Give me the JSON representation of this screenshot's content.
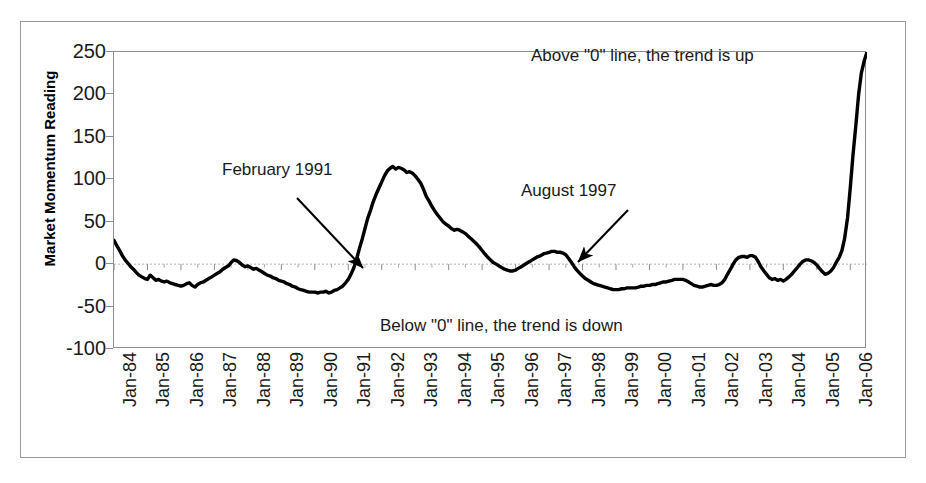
{
  "chart_data": {
    "type": "line",
    "title": "",
    "xlabel": "",
    "ylabel": "Market Momentum Reading",
    "ylim": [
      -100,
      250
    ],
    "ytick_values": [
      250,
      200,
      150,
      100,
      50,
      0,
      -50,
      -100
    ],
    "ytick_labels": [
      "250",
      "200",
      "150",
      "100",
      "50",
      "0",
      "-50",
      "-100"
    ],
    "grid": false,
    "zero_line": 0,
    "legend": "none",
    "xtick_labels": [
      "Jan-84",
      "Jan-85",
      "Jan-86",
      "Jan-87",
      "Jan-88",
      "Jan-89",
      "Jan-90",
      "Jan-91",
      "Jan-92",
      "Jan-93",
      "Jan-94",
      "Jan-95",
      "Jan-96",
      "Jan-97",
      "Jan-98",
      "Jan-99",
      "Jan-00",
      "Jan-01",
      "Jan-02",
      "Jan-03",
      "Jan-04",
      "Jan-05",
      "Jan-06"
    ],
    "series": [
      {
        "name": "Market Momentum Reading",
        "color": "#000000",
        "x": [
          1984.0,
          1984.08,
          1984.17,
          1984.25,
          1984.33,
          1984.42,
          1984.5,
          1984.58,
          1984.67,
          1984.75,
          1984.83,
          1984.92,
          1985.0,
          1985.08,
          1985.17,
          1985.25,
          1985.33,
          1985.42,
          1985.5,
          1985.58,
          1985.67,
          1985.75,
          1985.83,
          1985.92,
          1986.0,
          1986.08,
          1986.17,
          1986.25,
          1986.33,
          1986.42,
          1986.5,
          1986.58,
          1986.67,
          1986.75,
          1986.83,
          1986.92,
          1987.0,
          1987.08,
          1987.17,
          1987.25,
          1987.33,
          1987.42,
          1987.5,
          1987.58,
          1987.67,
          1987.75,
          1987.83,
          1987.92,
          1988.0,
          1988.08,
          1988.17,
          1988.25,
          1988.33,
          1988.42,
          1988.5,
          1988.58,
          1988.67,
          1988.75,
          1988.83,
          1988.92,
          1989.0,
          1989.08,
          1989.17,
          1989.25,
          1989.33,
          1989.42,
          1989.5,
          1989.58,
          1989.67,
          1989.75,
          1989.83,
          1989.92,
          1990.0,
          1990.08,
          1990.17,
          1990.25,
          1990.33,
          1990.42,
          1990.5,
          1990.58,
          1990.67,
          1990.75,
          1990.83,
          1990.92,
          1991.0,
          1991.08,
          1991.17,
          1991.25,
          1991.33,
          1991.42,
          1991.5,
          1991.58,
          1991.67,
          1991.75,
          1991.83,
          1991.92,
          1992.0,
          1992.08,
          1992.17,
          1992.25,
          1992.33,
          1992.42,
          1992.5,
          1992.58,
          1992.67,
          1992.75,
          1992.83,
          1992.92,
          1993.0,
          1993.08,
          1993.17,
          1993.25,
          1993.33,
          1993.42,
          1993.5,
          1993.58,
          1993.67,
          1993.75,
          1993.83,
          1993.92,
          1994.0,
          1994.08,
          1994.17,
          1994.25,
          1994.33,
          1994.42,
          1994.5,
          1994.58,
          1994.67,
          1994.75,
          1994.83,
          1994.92,
          1995.0,
          1995.08,
          1995.17,
          1995.25,
          1995.33,
          1995.42,
          1995.5,
          1995.58,
          1995.67,
          1995.75,
          1995.83,
          1995.92,
          1996.0,
          1996.08,
          1996.17,
          1996.25,
          1996.33,
          1996.42,
          1996.5,
          1996.58,
          1996.67,
          1996.75,
          1996.83,
          1996.92,
          1997.0,
          1997.08,
          1997.17,
          1997.25,
          1997.33,
          1997.42,
          1997.5,
          1997.58,
          1997.67,
          1997.75,
          1997.83,
          1997.92,
          1998.0,
          1998.08,
          1998.17,
          1998.25,
          1998.33,
          1998.42,
          1998.5,
          1998.58,
          1998.67,
          1998.75,
          1998.83,
          1998.92,
          1999.0,
          1999.08,
          1999.17,
          1999.25,
          1999.33,
          1999.42,
          1999.5,
          1999.58,
          1999.67,
          1999.75,
          1999.83,
          1999.92,
          2000.0,
          2000.08,
          2000.17,
          2000.25,
          2000.33,
          2000.42,
          2000.5,
          2000.58,
          2000.67,
          2000.75,
          2000.83,
          2000.92,
          2001.0,
          2001.08,
          2001.17,
          2001.25,
          2001.33,
          2001.42,
          2001.5,
          2001.58,
          2001.67,
          2001.75,
          2001.83,
          2001.92,
          2002.0,
          2002.08,
          2002.17,
          2002.25,
          2002.33,
          2002.42,
          2002.5,
          2002.58,
          2002.67,
          2002.75,
          2002.83,
          2002.92,
          2003.0,
          2003.08,
          2003.17,
          2003.25,
          2003.33,
          2003.42,
          2003.5,
          2003.58,
          2003.67,
          2003.75,
          2003.83,
          2003.92,
          2004.0,
          2004.08,
          2004.17,
          2004.25,
          2004.33,
          2004.42,
          2004.5,
          2004.58,
          2004.67,
          2004.75,
          2004.83,
          2004.92,
          2005.0,
          2005.08,
          2005.17,
          2005.25,
          2005.33,
          2005.42,
          2005.5,
          2005.58,
          2005.67,
          2005.75,
          2005.83,
          2005.92,
          2006.0,
          2006.08,
          2006.17,
          2006.25,
          2006.33,
          2006.42,
          2006.5
        ],
        "y": [
          28,
          22,
          16,
          10,
          5,
          1,
          -3,
          -6,
          -10,
          -13,
          -15,
          -17,
          -18,
          -13,
          -16,
          -19,
          -18,
          -20,
          -21,
          -20,
          -22,
          -23,
          -24,
          -25,
          -26,
          -25,
          -23,
          -22,
          -25,
          -27,
          -24,
          -22,
          -21,
          -19,
          -17,
          -15,
          -13,
          -11,
          -9,
          -6,
          -4,
          -2,
          2,
          5,
          4,
          2,
          -1,
          -3,
          -2,
          -4,
          -6,
          -5,
          -7,
          -9,
          -11,
          -13,
          -14,
          -16,
          -17,
          -19,
          -20,
          -21,
          -23,
          -24,
          -26,
          -27,
          -29,
          -30,
          -31,
          -32,
          -33,
          -33,
          -33,
          -34,
          -33,
          -33,
          -32,
          -34,
          -33,
          -31,
          -30,
          -28,
          -26,
          -22,
          -18,
          -12,
          -4,
          6,
          18,
          30,
          42,
          54,
          64,
          74,
          82,
          90,
          97,
          104,
          110,
          113,
          115,
          112,
          114,
          113,
          111,
          108,
          109,
          107,
          104,
          100,
          95,
          88,
          80,
          74,
          68,
          63,
          58,
          54,
          50,
          47,
          45,
          42,
          40,
          41,
          40,
          38,
          36,
          33,
          30,
          27,
          24,
          20,
          16,
          12,
          8,
          5,
          2,
          0,
          -2,
          -4,
          -6,
          -7,
          -8,
          -8,
          -7,
          -5,
          -3,
          -1,
          1,
          3,
          5,
          7,
          9,
          10,
          12,
          13,
          14,
          15,
          15,
          14,
          14,
          13,
          11,
          7,
          2,
          -3,
          -7,
          -11,
          -14,
          -17,
          -19,
          -21,
          -23,
          -24,
          -25,
          -26,
          -27,
          -28,
          -29,
          -30,
          -30,
          -30,
          -29,
          -29,
          -28,
          -28,
          -28,
          -28,
          -27,
          -26,
          -26,
          -25,
          -25,
          -24,
          -24,
          -23,
          -22,
          -21,
          -21,
          -20,
          -19,
          -18,
          -18,
          -18,
          -18,
          -19,
          -21,
          -23,
          -25,
          -26,
          -27,
          -27,
          -26,
          -25,
          -24,
          -25,
          -25,
          -24,
          -22,
          -18,
          -12,
          -6,
          0,
          5,
          8,
          9,
          9,
          8,
          10,
          10,
          8,
          3,
          -3,
          -8,
          -12,
          -16,
          -18,
          -17,
          -19,
          -18,
          -20,
          -18,
          -15,
          -12,
          -8,
          -4,
          0,
          3,
          5,
          5,
          4,
          2,
          -1,
          -5,
          -9,
          -12,
          -11,
          -8,
          -4,
          2,
          8,
          16,
          30,
          55,
          90,
          128,
          165,
          200,
          225,
          240,
          250
        ]
      }
    ],
    "annotations": [
      {
        "id": "above-zero-note",
        "text": "Above \"0\" line, the trend is up",
        "x_px": 531,
        "y_px": 46
      },
      {
        "id": "below-zero-note",
        "text": "Below \"0\" line, the trend is down",
        "x_px": 380,
        "y_px": 316
      },
      {
        "id": "feb-1991-label",
        "text": "February 1991",
        "x_px": 222,
        "y_px": 160,
        "arrow_from": [
          297,
          198
        ],
        "arrow_to": [
          363,
          268
        ]
      },
      {
        "id": "aug-1997-label",
        "text": "August 1997",
        "x_px": 521,
        "y_px": 181,
        "arrow_from": [
          628,
          210
        ],
        "arrow_to": [
          578,
          262
        ]
      }
    ]
  },
  "figure": {
    "background": "#ffffff",
    "frame_color": "#9a9a9a",
    "axis_color": "#8d8d8d",
    "line_color": "#000000",
    "text_color": "#1a1a1a"
  }
}
